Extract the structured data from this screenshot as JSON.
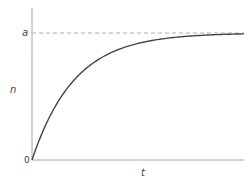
{
  "chart_data": {
    "type": "line",
    "title": "",
    "xlabel": "t",
    "ylabel": "n",
    "function": "n = a(1 - exp(-t/tau))",
    "tau_normalized": 0.2,
    "x": [
      0,
      0.05,
      0.1,
      0.15,
      0.2,
      0.3,
      0.4,
      0.5,
      0.6,
      0.7,
      0.8,
      0.9,
      1.0
    ],
    "series": [
      {
        "name": "n(t)",
        "values": [
          0,
          0.221,
          0.393,
          0.528,
          0.632,
          0.777,
          0.865,
          0.918,
          0.95,
          0.97,
          0.982,
          0.989,
          0.993
        ]
      }
    ],
    "asymptote": {
      "label": "a",
      "value": 1.0,
      "style": "dashed"
    },
    "y_tick_labels": [
      "0",
      "a"
    ],
    "x_tick_labels": [],
    "xlim": [
      0,
      1
    ],
    "ylim": [
      0,
      1.2
    ],
    "grid": false,
    "legend": null,
    "colors": {
      "curve": "#444444",
      "axis": "#999999",
      "asymptote": "#aaaaaa"
    }
  },
  "labels": {
    "y_axis": "n",
    "x_axis": "t",
    "origin": "0",
    "asymptote": "a"
  }
}
